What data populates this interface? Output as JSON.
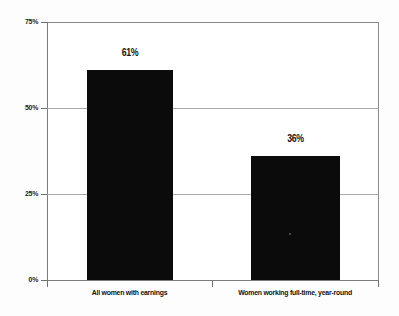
{
  "chart_data": {
    "type": "bar",
    "title": "",
    "subtitle": "",
    "xlabel": "",
    "ylabel": "",
    "categories": [
      "All women with earnings",
      "Women working full-time, year-round"
    ],
    "values": [
      61,
      36
    ],
    "value_labels": [
      "61%",
      "36%"
    ],
    "ylim": [
      0,
      75
    ],
    "yticks": [
      0,
      25,
      50,
      75
    ],
    "ytick_labels": [
      "0%",
      "25%",
      "50%",
      "75%"
    ],
    "grid": {
      "horizontal": true,
      "horizontal_at": [
        25,
        50
      ],
      "vertical": false
    },
    "legend": {
      "present": false,
      "position": "none",
      "entries": []
    },
    "annotations": [],
    "bar_color": "#0b0b0b",
    "background_color": "#ffffff",
    "axis_color": "#7a7a7a",
    "gridline_color": "#a9a9a9",
    "label_color": "#161616"
  },
  "axis": {
    "y": {
      "tick_75": "75%",
      "tick_50": "50%",
      "tick_25": "25%",
      "tick_0": "0%"
    },
    "x": {
      "category_1": "All women with earnings",
      "category_2": "Women working full-time, year-round"
    }
  },
  "bars": [
    {
      "name": "all-women-with-earnings",
      "label": "All women with earnings",
      "value_label": "61%",
      "value": 61
    },
    {
      "name": "women-working-full-time-year-round",
      "label": "Women working full-time, year-round",
      "value_label": "36%",
      "value": 36
    }
  ]
}
